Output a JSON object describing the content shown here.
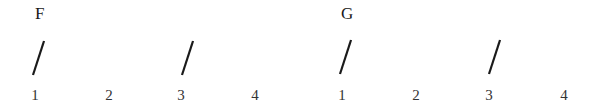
{
  "diagram": {
    "type": "strumming-pattern",
    "measures": [
      {
        "chord": "F",
        "beats": [
          "1",
          "2",
          "3",
          "4"
        ],
        "strums": [
          true,
          false,
          true,
          false
        ]
      },
      {
        "chord": "G",
        "beats": [
          "1",
          "2",
          "3",
          "4"
        ],
        "strums": [
          true,
          false,
          true,
          false
        ]
      }
    ]
  }
}
